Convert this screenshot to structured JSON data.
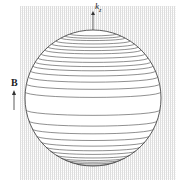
{
  "diagram": {
    "axis_label": "k",
    "axis_subscript": "z",
    "field_label": "B",
    "sphere": {
      "cx": 93,
      "cy": 98,
      "r": 68
    },
    "slice_offsets": [
      -64,
      -62,
      -60,
      -57,
      -54,
      -51,
      -48,
      -44,
      -40,
      -36,
      -32,
      -27,
      -21,
      -14,
      -6,
      12,
      23,
      31,
      38,
      44,
      49,
      53,
      57,
      60,
      62,
      64,
      66
    ],
    "colors": {
      "line": "#444444",
      "hatch": "#bbbbbb"
    }
  }
}
